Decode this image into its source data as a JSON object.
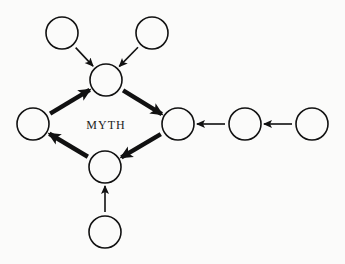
{
  "diagram": {
    "center_label": "MYTH",
    "nodes": [
      {
        "id": "top-left",
        "x": 62,
        "y": 33
      },
      {
        "id": "top-right",
        "x": 152,
        "y": 33
      },
      {
        "id": "top-center",
        "x": 106,
        "y": 80
      },
      {
        "id": "left",
        "x": 33,
        "y": 124
      },
      {
        "id": "right",
        "x": 178,
        "y": 124
      },
      {
        "id": "right-2",
        "x": 245,
        "y": 124
      },
      {
        "id": "right-3",
        "x": 312,
        "y": 124
      },
      {
        "id": "bottom-center",
        "x": 105,
        "y": 167
      },
      {
        "id": "bottom",
        "x": 105,
        "y": 232
      }
    ],
    "edges": [
      {
        "from": "top-left",
        "to": "top-center",
        "weight": "thin"
      },
      {
        "from": "top-right",
        "to": "top-center",
        "weight": "thin"
      },
      {
        "from": "top-center",
        "to": "right",
        "weight": "thick"
      },
      {
        "from": "right",
        "to": "bottom-center",
        "weight": "thick"
      },
      {
        "from": "bottom-center",
        "to": "left",
        "weight": "thick"
      },
      {
        "from": "left",
        "to": "top-center",
        "weight": "thick"
      },
      {
        "from": "right-2",
        "to": "right",
        "weight": "thin"
      },
      {
        "from": "right-3",
        "to": "right-2",
        "weight": "thin"
      },
      {
        "from": "bottom",
        "to": "bottom-center",
        "weight": "thin"
      }
    ]
  }
}
